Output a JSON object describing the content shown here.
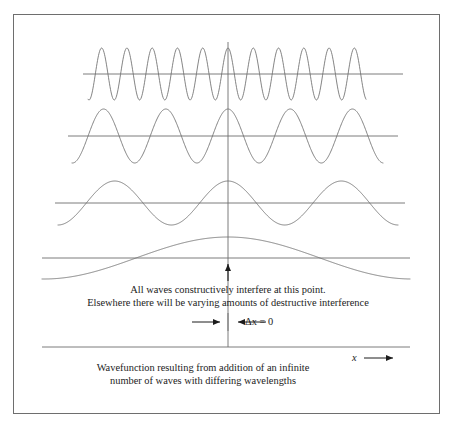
{
  "figure": {
    "annotations": {
      "interference_line1": "All waves constructively interfere at this point.",
      "interference_line2": "Elsewhere there will be varying amounts of destructive interference",
      "delta_x_label": "Δx = 0",
      "caption_line1": "Wavefunction resulting from addition of an infinite",
      "caption_line2": "number of waves with differing wavelengths",
      "x_axis_label": "x"
    },
    "colors": {
      "line": "#6e6e6e",
      "border": "#6e6e6e",
      "text": "#1c1c1c",
      "background": "#ffffff",
      "arrow": "#1c1c1c"
    }
  },
  "chart_data": {
    "type": "line",
    "title": "",
    "subtitle": "",
    "xlabel": "x",
    "ylabel": "",
    "grid": false,
    "legend": null,
    "center_x": 0,
    "series": [
      {
        "name": "wave-1-highest-frequency",
        "form": "cosine",
        "cycles_visible": 11,
        "relative_wavelength": 1,
        "amplitude": 26,
        "baseline_y_px": 74,
        "x_start_px": 88,
        "x_end_px": 366
      },
      {
        "name": "wave-2",
        "form": "cosine",
        "cycles_visible": 5,
        "relative_wavelength": 2.2,
        "amplitude": 27,
        "baseline_y_px": 136,
        "x_start_px": 72,
        "x_end_px": 383
      },
      {
        "name": "wave-3",
        "form": "cosine",
        "cycles_visible": 3,
        "relative_wavelength": 3.7,
        "amplitude": 22,
        "baseline_y_px": 203,
        "x_start_px": 58,
        "x_end_px": 398
      },
      {
        "name": "wave-4-lowest-frequency",
        "form": "cosine",
        "cycles_visible": 1,
        "relative_wavelength": 11,
        "amplitude": 21,
        "baseline_y_px": 258,
        "x_start_px": 42,
        "x_end_px": 410
      }
    ],
    "axes": [
      {
        "name": "baseline-1",
        "y_px": 74,
        "x_start_px": 83,
        "x_end_px": 403
      },
      {
        "name": "baseline-2",
        "y_px": 136,
        "x_start_px": 68,
        "x_end_px": 398
      },
      {
        "name": "baseline-3",
        "y_px": 203,
        "x_start_px": 55,
        "x_end_px": 405
      },
      {
        "name": "baseline-4",
        "y_px": 258,
        "x_start_px": 42,
        "x_end_px": 410
      },
      {
        "name": "bottom-axis",
        "y_px": 347,
        "x_start_px": 42,
        "x_end_px": 410
      },
      {
        "name": "center-vertical",
        "x_px": 228,
        "y_start_px": 42,
        "y_end_px": 347
      }
    ]
  }
}
